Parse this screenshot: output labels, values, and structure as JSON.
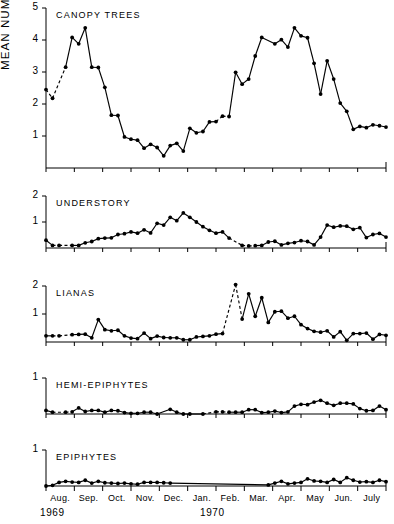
{
  "axis_title": "MEAN NUMBER OF SPECIES",
  "axis_title_unit": "· PLOT",
  "axis_title_exponent": "-1",
  "years": [
    {
      "label": "1969",
      "x": 40
    },
    {
      "label": "1970",
      "x": 200
    }
  ],
  "months": [
    "Aug.",
    "Sep.",
    "Oct.",
    "Nov.",
    "Dec.",
    "Jan.",
    "Feb.",
    "Mar.",
    "Apr.",
    "May",
    "Jun.",
    "July"
  ],
  "colors": {
    "ink": "#000000",
    "background": "#ffffff"
  },
  "chart_data": [
    {
      "type": "line",
      "title": "CANOPY TREES",
      "xlabel": "",
      "ylabel": "MEAN NUMBER OF SPECIES · PLOT-1",
      "ylim": [
        0,
        5
      ],
      "yticks": [
        1,
        2,
        3,
        4,
        5
      ],
      "xlim": [
        0,
        52
      ],
      "grid": false,
      "legend": "none",
      "x": [
        0,
        1,
        3,
        4,
        5,
        6,
        7,
        8,
        9,
        10,
        11,
        12,
        13,
        14,
        15,
        16,
        17,
        18,
        19,
        20,
        21,
        22,
        23,
        24,
        25,
        26,
        27,
        28,
        29,
        30,
        31,
        32,
        33,
        35,
        36,
        37,
        38,
        39,
        40,
        41,
        42,
        43,
        44,
        45,
        46,
        47,
        48,
        49,
        50,
        51,
        52
      ],
      "values": [
        2.45,
        2.18,
        3.15,
        4.08,
        3.88,
        4.38,
        3.15,
        3.14,
        2.52,
        1.65,
        1.64,
        0.97,
        0.9,
        0.87,
        0.62,
        0.74,
        0.64,
        0.38,
        0.7,
        0.77,
        0.53,
        1.24,
        1.1,
        1.14,
        1.44,
        1.45,
        1.62,
        1.61,
        2.99,
        2.62,
        2.78,
        3.5,
        4.08,
        3.88,
        4.01,
        3.78,
        4.38,
        4.13,
        4.07,
        3.27,
        2.31,
        3.35,
        2.78,
        2.03,
        1.77,
        1.21,
        1.3,
        1.26,
        1.35,
        1.32,
        1.28
      ],
      "dashed_segments": [
        [
          0,
          1
        ],
        [
          1,
          2
        ],
        [
          25,
          26
        ],
        [
          26,
          27
        ]
      ]
    },
    {
      "type": "line",
      "title": "UNDERSTORY",
      "xlabel": "",
      "ylabel": "",
      "ylim": [
        0,
        2
      ],
      "yticks": [
        1,
        2
      ],
      "xlim": [
        0,
        52
      ],
      "grid": false,
      "legend": "none",
      "x": [
        0,
        1,
        2,
        4,
        5,
        6,
        7,
        8,
        9,
        10,
        11,
        12,
        13,
        14,
        15,
        16,
        17,
        18,
        19,
        20,
        21,
        22,
        23,
        24,
        25,
        26,
        27,
        28,
        30,
        31,
        32,
        33,
        34,
        35,
        36,
        37,
        38,
        39,
        40,
        41,
        42,
        43,
        44,
        45,
        46,
        47,
        48,
        49,
        50,
        51,
        52
      ],
      "values": [
        0.3,
        0.1,
        0.1,
        0.1,
        0.1,
        0.2,
        0.25,
        0.36,
        0.38,
        0.39,
        0.52,
        0.55,
        0.62,
        0.57,
        0.7,
        0.58,
        0.95,
        0.88,
        1.18,
        1.05,
        1.35,
        1.18,
        1.0,
        0.82,
        0.68,
        0.57,
        0.62,
        0.38,
        0.1,
        0.08,
        0.09,
        0.1,
        0.23,
        0.26,
        0.12,
        0.18,
        0.21,
        0.28,
        0.25,
        0.12,
        0.42,
        0.88,
        0.8,
        0.85,
        0.84,
        0.72,
        0.78,
        0.4,
        0.52,
        0.56,
        0.42
      ],
      "dashed_segments": [
        [
          1,
          2
        ],
        [
          2,
          3
        ],
        [
          27,
          28
        ],
        [
          28,
          29
        ],
        [
          29,
          30
        ]
      ]
    },
    {
      "type": "line",
      "title": "LIANAS",
      "xlabel": "",
      "ylabel": "",
      "ylim": [
        0,
        2
      ],
      "yticks": [
        1,
        2
      ],
      "xlim": [
        0,
        52
      ],
      "grid": false,
      "legend": "none",
      "x": [
        0,
        1,
        2,
        4,
        5,
        6,
        7,
        8,
        9,
        10,
        11,
        12,
        13,
        14,
        15,
        16,
        17,
        18,
        19,
        20,
        21,
        22,
        23,
        24,
        25,
        26,
        27,
        29,
        30,
        31,
        32,
        33,
        34,
        35,
        36,
        37,
        38,
        39,
        40,
        41,
        42,
        43,
        44,
        45,
        46,
        47,
        48,
        49,
        50,
        51,
        52
      ],
      "values": [
        0.22,
        0.22,
        0.22,
        0.26,
        0.27,
        0.28,
        0.15,
        0.8,
        0.44,
        0.4,
        0.42,
        0.22,
        0.14,
        0.12,
        0.32,
        0.12,
        0.21,
        0.16,
        0.15,
        0.15,
        0.08,
        0.08,
        0.18,
        0.2,
        0.22,
        0.28,
        0.3,
        2.05,
        0.82,
        1.72,
        0.92,
        1.58,
        0.7,
        1.08,
        1.1,
        0.85,
        0.92,
        0.62,
        0.48,
        0.38,
        0.35,
        0.4,
        0.18,
        0.37,
        0.06,
        0.3,
        0.3,
        0.32,
        0.1,
        0.27,
        0.24
      ],
      "dashed_segments": [
        [
          1,
          2
        ],
        [
          2,
          3
        ],
        [
          26,
          27
        ],
        [
          27,
          28
        ]
      ]
    },
    {
      "type": "line",
      "title": "HEMI-EPIPHYTES",
      "xlabel": "",
      "ylabel": "",
      "ylim": [
        0,
        1
      ],
      "yticks": [
        1
      ],
      "xlim": [
        0,
        52
      ],
      "grid": false,
      "legend": "none",
      "x": [
        0,
        1,
        3,
        4,
        5,
        6,
        7,
        8,
        9,
        10,
        11,
        12,
        13,
        14,
        15,
        16,
        17,
        19,
        20,
        21,
        22,
        24,
        26,
        27,
        28,
        29,
        30,
        31,
        32,
        33,
        34,
        35,
        36,
        37,
        38,
        39,
        40,
        41,
        42,
        43,
        44,
        45,
        46,
        47,
        48,
        49,
        50,
        51,
        52
      ],
      "values": [
        0.1,
        0.05,
        0.05,
        0.06,
        0.17,
        0.07,
        0.1,
        0.1,
        0.05,
        0.1,
        0.09,
        0.04,
        0.02,
        0.02,
        0.05,
        0.05,
        0.0,
        0.13,
        0.05,
        0.0,
        0.0,
        0.0,
        0.06,
        0.06,
        0.05,
        0.05,
        0.05,
        0.12,
        0.12,
        0.04,
        0.05,
        0.08,
        0.04,
        0.06,
        0.22,
        0.27,
        0.26,
        0.33,
        0.38,
        0.3,
        0.24,
        0.3,
        0.3,
        0.28,
        0.15,
        0.09,
        0.1,
        0.22,
        0.12
      ],
      "dashed_segments": [
        [
          1,
          2
        ],
        [
          2,
          3
        ],
        [
          21,
          22
        ],
        [
          22,
          23
        ],
        [
          23,
          24
        ]
      ]
    },
    {
      "type": "line",
      "title": "EPIPHYTES",
      "xlabel": "",
      "ylabel": "",
      "ylim": [
        0,
        1
      ],
      "yticks": [
        1
      ],
      "xlim": [
        0,
        52
      ],
      "grid": false,
      "legend": "none",
      "x": [
        0,
        1,
        2,
        3,
        4,
        5,
        6,
        7,
        8,
        9,
        10,
        11,
        12,
        13,
        14,
        15,
        16,
        17,
        18,
        19,
        34,
        35,
        36,
        37,
        38,
        39,
        40,
        41,
        42,
        43,
        44,
        45,
        46,
        47,
        48,
        49,
        50,
        51,
        52
      ],
      "values": [
        0.0,
        0.02,
        0.1,
        0.13,
        0.11,
        0.1,
        0.16,
        0.08,
        0.13,
        0.09,
        0.08,
        0.07,
        0.08,
        0.06,
        0.05,
        0.1,
        0.1,
        0.1,
        0.09,
        0.08,
        0.03,
        0.08,
        0.13,
        0.06,
        0.08,
        0.1,
        0.2,
        0.14,
        0.13,
        0.1,
        0.18,
        0.1,
        0.23,
        0.16,
        0.11,
        0.12,
        0.1,
        0.16,
        0.12
      ],
      "dashed_segments": []
    }
  ]
}
